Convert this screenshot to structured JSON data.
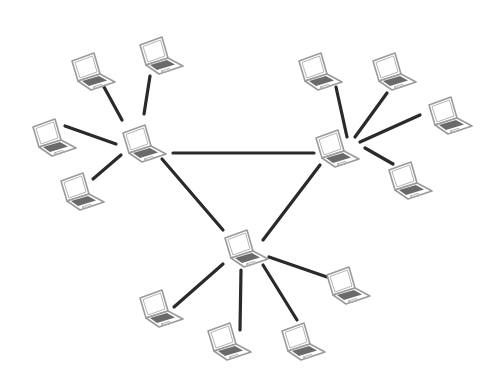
{
  "diagram": {
    "type": "network-topology",
    "colors": {
      "background": "#ffffff",
      "link": "#2a2a2a",
      "laptop_outline": "#9a9a9a",
      "keyboard": "#6a6a6a"
    },
    "nodes": [
      {
        "id": "hub-left",
        "role": "hub",
        "icon": "laptop-icon",
        "x": 120,
        "y": 122
      },
      {
        "id": "hub-right",
        "role": "hub",
        "icon": "laptop-icon",
        "x": 313,
        "y": 127
      },
      {
        "id": "hub-bottom",
        "role": "hub",
        "icon": "laptop-icon",
        "x": 222,
        "y": 227
      },
      {
        "id": "left-top-a",
        "role": "client",
        "icon": "laptop-icon",
        "x": 69,
        "y": 50
      },
      {
        "id": "left-top-b",
        "role": "client",
        "icon": "laptop-icon",
        "x": 137,
        "y": 34
      },
      {
        "id": "left-mid",
        "role": "client",
        "icon": "laptop-icon",
        "x": 30,
        "y": 116
      },
      {
        "id": "left-low",
        "role": "client",
        "icon": "laptop-icon",
        "x": 58,
        "y": 170
      },
      {
        "id": "right-top-a",
        "role": "client",
        "icon": "laptop-icon",
        "x": 296,
        "y": 50
      },
      {
        "id": "right-top-b",
        "role": "client",
        "icon": "laptop-icon",
        "x": 370,
        "y": 50
      },
      {
        "id": "right-mid",
        "role": "client",
        "icon": "laptop-icon",
        "x": 426,
        "y": 94
      },
      {
        "id": "right-low",
        "role": "client",
        "icon": "laptop-icon",
        "x": 386,
        "y": 159
      },
      {
        "id": "bottom-left",
        "role": "client",
        "icon": "laptop-icon",
        "x": 137,
        "y": 287
      },
      {
        "id": "bottom-mid-a",
        "role": "client",
        "icon": "laptop-icon",
        "x": 205,
        "y": 320
      },
      {
        "id": "bottom-mid-b",
        "role": "client",
        "icon": "laptop-icon",
        "x": 279,
        "y": 320
      },
      {
        "id": "bottom-right",
        "role": "client",
        "icon": "laptop-icon",
        "x": 324,
        "y": 264
      }
    ],
    "links": [
      {
        "from": "hub-left",
        "to": "hub-right",
        "x1": 173,
        "y1": 153,
        "x2": 314,
        "y2": 153
      },
      {
        "from": "hub-left",
        "to": "hub-bottom",
        "x1": 162,
        "y1": 159,
        "x2": 223,
        "y2": 230
      },
      {
        "from": "hub-right",
        "to": "hub-bottom",
        "x1": 320,
        "y1": 165,
        "x2": 263,
        "y2": 240
      },
      {
        "from": "left-top-a",
        "to": "hub-left",
        "x1": 104,
        "y1": 87,
        "x2": 122,
        "y2": 120
      },
      {
        "from": "left-top-b",
        "to": "hub-left",
        "x1": 150,
        "y1": 76,
        "x2": 144,
        "y2": 114
      },
      {
        "from": "left-mid",
        "to": "hub-left",
        "x1": 65,
        "y1": 126,
        "x2": 116,
        "y2": 144
      },
      {
        "from": "left-low",
        "to": "hub-left",
        "x1": 93,
        "y1": 179,
        "x2": 121,
        "y2": 155
      },
      {
        "from": "right-top-a",
        "to": "hub-right",
        "x1": 336,
        "y1": 87,
        "x2": 347,
        "y2": 137
      },
      {
        "from": "right-top-b",
        "to": "hub-right",
        "x1": 387,
        "y1": 93,
        "x2": 355,
        "y2": 137
      },
      {
        "from": "right-mid",
        "to": "hub-right",
        "x1": 420,
        "y1": 115,
        "x2": 360,
        "y2": 142
      },
      {
        "from": "right-low",
        "to": "hub-right",
        "x1": 365,
        "y1": 148,
        "x2": 393,
        "y2": 164
      },
      {
        "from": "hub-bottom",
        "to": "bottom-left",
        "x1": 223,
        "y1": 264,
        "x2": 174,
        "y2": 307
      },
      {
        "from": "hub-bottom",
        "to": "bottom-mid-a",
        "x1": 241,
        "y1": 270,
        "x2": 240,
        "y2": 330
      },
      {
        "from": "hub-bottom",
        "to": "bottom-mid-b",
        "x1": 263,
        "y1": 265,
        "x2": 297,
        "y2": 320
      },
      {
        "from": "hub-bottom",
        "to": "bottom-right",
        "x1": 269,
        "y1": 257,
        "x2": 327,
        "y2": 277
      }
    ]
  }
}
